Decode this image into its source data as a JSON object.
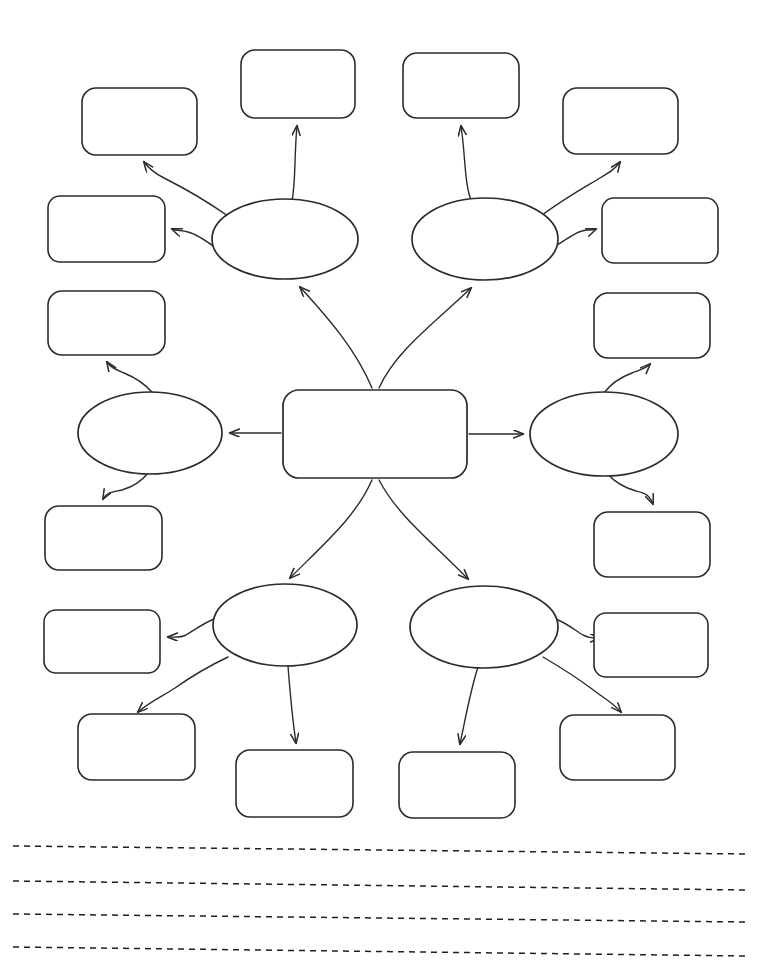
{
  "page": {
    "background_color": "#ffffff",
    "ink_color": "#2b2b2b",
    "width": 767,
    "height": 972
  },
  "diagram": {
    "type": "concept-map",
    "center": {
      "label": "",
      "shape": "rounded-rectangle",
      "x": 283,
      "y": 390,
      "width": 184,
      "height": 88
    },
    "ovals": [
      {
        "id": "oval-top-left",
        "label": "",
        "cx": 285,
        "cy": 239,
        "rx": 73,
        "ry": 40
      },
      {
        "id": "oval-top-right",
        "label": "",
        "cx": 485,
        "cy": 239,
        "rx": 73,
        "ry": 41
      },
      {
        "id": "oval-middle-left",
        "label": "",
        "cx": 150,
        "cy": 433,
        "rx": 72,
        "ry": 41
      },
      {
        "id": "oval-middle-right",
        "label": "",
        "cx": 604,
        "cy": 434,
        "rx": 74,
        "ry": 42
      },
      {
        "id": "oval-bottom-left",
        "label": "",
        "cx": 285,
        "cy": 625,
        "rx": 72,
        "ry": 41
      },
      {
        "id": "oval-bottom-right",
        "label": "",
        "cx": 484,
        "cy": 627,
        "rx": 74,
        "ry": 41
      }
    ],
    "boxes": [
      {
        "id": "box-top-left-upper",
        "label": "",
        "x": 241,
        "y": 50,
        "width": 114,
        "height": 68
      },
      {
        "id": "box-top-right-upper",
        "label": "",
        "x": 403,
        "y": 53,
        "width": 116,
        "height": 65
      },
      {
        "id": "box-upper-left-outer",
        "label": "",
        "x": 82,
        "y": 88,
        "width": 115,
        "height": 67
      },
      {
        "id": "box-upper-right-outer",
        "label": "",
        "x": 563,
        "y": 88,
        "width": 115,
        "height": 66
      },
      {
        "id": "box-left-side-upper",
        "label": "",
        "x": 48,
        "y": 196,
        "width": 117,
        "height": 66
      },
      {
        "id": "box-right-side-upper",
        "label": "",
        "x": 602,
        "y": 198,
        "width": 116,
        "height": 65
      },
      {
        "id": "box-left-side-middle",
        "label": "",
        "x": 48,
        "y": 291,
        "width": 117,
        "height": 64
      },
      {
        "id": "box-right-side-middle",
        "label": "",
        "x": 594,
        "y": 293,
        "width": 116,
        "height": 65
      },
      {
        "id": "box-left-side-lower",
        "label": "",
        "x": 45,
        "y": 506,
        "width": 117,
        "height": 64
      },
      {
        "id": "box-right-side-lower",
        "label": "",
        "x": 594,
        "y": 512,
        "width": 116,
        "height": 65
      },
      {
        "id": "box-lower-left-outer",
        "label": "",
        "x": 44,
        "y": 610,
        "width": 116,
        "height": 63
      },
      {
        "id": "box-lower-right-outer",
        "label": "",
        "x": 594,
        "y": 613,
        "width": 114,
        "height": 64
      },
      {
        "id": "box-bottom-left-outer",
        "label": "",
        "x": 78,
        "y": 714,
        "width": 117,
        "height": 66
      },
      {
        "id": "box-bottom-right-outer",
        "label": "",
        "x": 560,
        "y": 715,
        "width": 115,
        "height": 65
      },
      {
        "id": "box-bottom-center-left",
        "label": "",
        "x": 236,
        "y": 750,
        "width": 117,
        "height": 67
      },
      {
        "id": "box-bottom-center-right",
        "label": "",
        "x": 399,
        "y": 752,
        "width": 116,
        "height": 66
      }
    ],
    "connectors": [
      {
        "id": "arrow-center-to-oval-top-left",
        "from": "center",
        "to": "oval-top-left",
        "arrowhead": true
      },
      {
        "id": "arrow-center-to-oval-top-right",
        "from": "center",
        "to": "oval-top-right",
        "arrowhead": true
      },
      {
        "id": "arrow-center-to-oval-middle-left",
        "from": "center",
        "to": "oval-middle-left",
        "arrowhead": true
      },
      {
        "id": "arrow-center-to-oval-middle-right",
        "from": "center",
        "to": "oval-middle-right",
        "arrowhead": true
      },
      {
        "id": "arrow-center-to-oval-bottom-left",
        "from": "center",
        "to": "oval-bottom-left",
        "arrowhead": true
      },
      {
        "id": "arrow-center-to-oval-bottom-right",
        "from": "center",
        "to": "oval-bottom-right",
        "arrowhead": true
      },
      {
        "id": "arrow-oval-top-left-to-box-upper-left",
        "from": "oval-top-left",
        "to": "box-upper-left-outer",
        "arrowhead": true
      },
      {
        "id": "arrow-oval-top-left-to-box-top",
        "from": "oval-top-left",
        "to": "box-top-left-upper",
        "arrowhead": true
      },
      {
        "id": "arrow-oval-top-left-to-box-left-side",
        "from": "oval-top-left",
        "to": "box-left-side-upper",
        "arrowhead": true
      },
      {
        "id": "arrow-oval-top-right-to-box-top",
        "from": "oval-top-right",
        "to": "box-top-right-upper",
        "arrowhead": true
      },
      {
        "id": "arrow-oval-top-right-to-box-upper-right",
        "from": "oval-top-right",
        "to": "box-upper-right-outer",
        "arrowhead": true
      },
      {
        "id": "arrow-oval-top-right-to-box-right-side",
        "from": "oval-top-right",
        "to": "box-right-side-upper",
        "arrowhead": true
      },
      {
        "id": "arrow-oval-middle-left-to-box-upper",
        "from": "oval-middle-left",
        "to": "box-left-side-middle",
        "arrowhead": true
      },
      {
        "id": "arrow-oval-middle-left-to-box-lower",
        "from": "oval-middle-left",
        "to": "box-left-side-lower",
        "arrowhead": true
      },
      {
        "id": "arrow-oval-middle-right-to-box-upper",
        "from": "oval-middle-right",
        "to": "box-right-side-middle",
        "arrowhead": true
      },
      {
        "id": "arrow-oval-middle-right-to-box-lower",
        "from": "oval-middle-right",
        "to": "box-right-side-lower",
        "arrowhead": true
      },
      {
        "id": "arrow-oval-bottom-left-to-box-left",
        "from": "oval-bottom-left",
        "to": "box-lower-left-outer",
        "arrowhead": true
      },
      {
        "id": "arrow-oval-bottom-left-to-box-corner",
        "from": "oval-bottom-left",
        "to": "box-bottom-left-outer",
        "arrowhead": true
      },
      {
        "id": "arrow-oval-bottom-left-to-box-center",
        "from": "oval-bottom-left",
        "to": "box-bottom-center-left",
        "arrowhead": true
      },
      {
        "id": "arrow-oval-bottom-right-to-box-center",
        "from": "oval-bottom-right",
        "to": "box-bottom-center-right",
        "arrowhead": true
      },
      {
        "id": "arrow-oval-bottom-right-to-box-right",
        "from": "oval-bottom-right",
        "to": "box-lower-right-outer",
        "arrowhead": true
      },
      {
        "id": "arrow-oval-bottom-right-to-box-corner",
        "from": "oval-bottom-right",
        "to": "box-bottom-right-outer",
        "arrowhead": true
      }
    ]
  },
  "writing_lines": {
    "count": 4,
    "style": "dashed",
    "lines": [
      {
        "id": "writing-line-1",
        "text": "",
        "x1": 13,
        "y1": 846,
        "x2": 746,
        "y2": 854
      },
      {
        "id": "writing-line-2",
        "text": "",
        "x1": 13,
        "y1": 881,
        "x2": 746,
        "y2": 890
      },
      {
        "id": "writing-line-3",
        "text": "",
        "x1": 13,
        "y1": 914,
        "x2": 746,
        "y2": 922
      },
      {
        "id": "writing-line-4",
        "text": "",
        "x1": 13,
        "y1": 947,
        "x2": 746,
        "y2": 956
      }
    ]
  }
}
